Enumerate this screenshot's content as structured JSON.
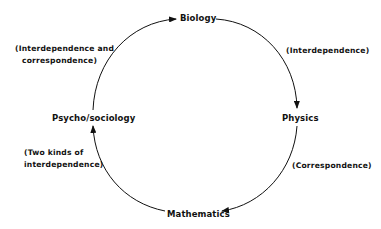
{
  "diagram": {
    "type": "cycle",
    "nodes": [
      {
        "id": "biology",
        "label": "Biology"
      },
      {
        "id": "physics",
        "label": "Physics"
      },
      {
        "id": "mathematics",
        "label": "Mathematics"
      },
      {
        "id": "psycho_sociology",
        "label": "Psycho/sociology"
      }
    ],
    "edges": [
      {
        "from": "psycho_sociology",
        "to": "biology",
        "label_lines": [
          "(Interdependence and",
          "correspondence)"
        ]
      },
      {
        "from": "biology",
        "to": "physics",
        "label_lines": [
          "(Interdependence)"
        ]
      },
      {
        "from": "physics",
        "to": "mathematics",
        "label_lines": [
          "(Correspondence)"
        ]
      },
      {
        "from": "mathematics",
        "to": "psycho_sociology",
        "label_lines": [
          "(Two kinds of",
          "interdependence)"
        ]
      }
    ],
    "colors": {
      "line": "#111111",
      "text": "#111111",
      "background": "#ffffff"
    }
  }
}
